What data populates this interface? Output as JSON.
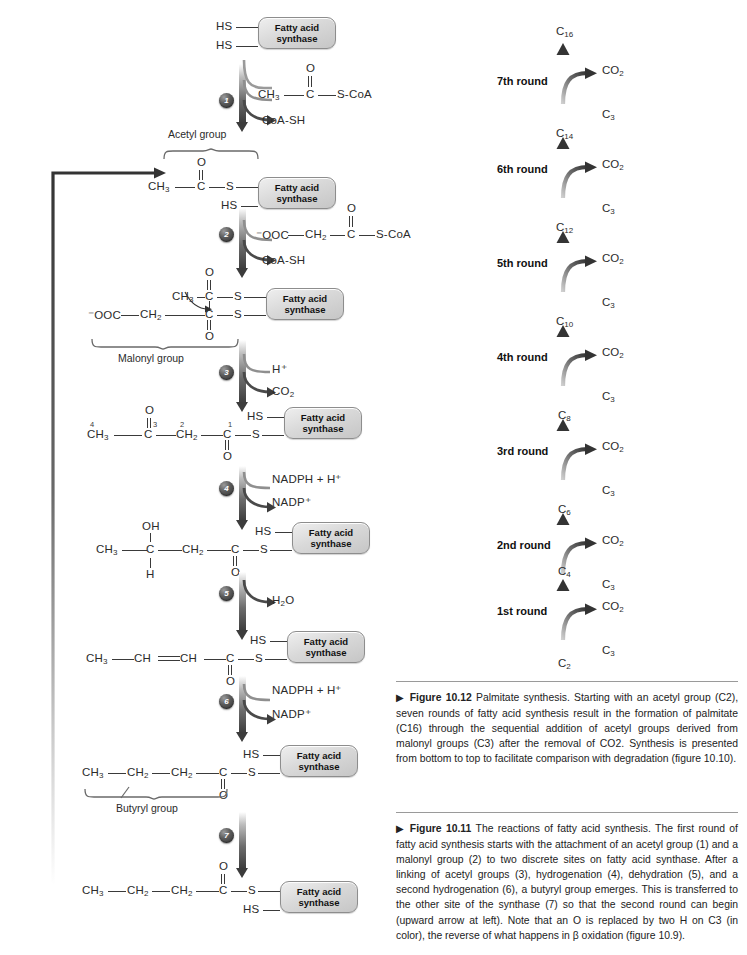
{
  "figure_11": {
    "enzyme_box_line1": "Fatty acid",
    "enzyme_box_line2": "synthase",
    "structures": {
      "s0": {
        "label_top": "HS",
        "label_bottom": "HS"
      },
      "s1_acetyl": {
        "ch3": "CH3",
        "c": "C",
        "o": "O",
        "s": "S",
        "hs": "HS"
      },
      "s2_malonyl": {
        "ooc": "⁻OOC",
        "ch2": "CH2",
        "ch3": "CH3",
        "c_top": "C",
        "c_bottom": "C",
        "o_top": "O",
        "o_bottom": "O",
        "s_top": "S",
        "s_bottom": "S"
      },
      "s3_acetoacetyl": {
        "c4": "4",
        "ch3": "CH3",
        "c3": "3",
        "c": "C",
        "o_up": "O",
        "c2": "2",
        "ch2": "CH2",
        "c1": "1",
        "c_carbonyl": "C",
        "o_down": "O",
        "s": "S",
        "hs": "HS"
      },
      "s4_hydroxy": {
        "ch3": "CH3",
        "oh": "OH",
        "c": "C",
        "h": "H",
        "ch2": "CH2",
        "c_carbonyl": "C",
        "o": "O",
        "s": "S",
        "hs": "HS"
      },
      "s5_enoyl": {
        "ch3": "CH3",
        "ch_a": "CH",
        "ch_b": "CH",
        "c": "C",
        "o": "O",
        "s": "S",
        "hs": "HS"
      },
      "s6_butyryl": {
        "ch3": "CH3",
        "ch2_a": "CH2",
        "ch2_b": "CH2",
        "c": "C",
        "o": "O",
        "s": "S",
        "hs": "HS"
      },
      "s7_transferred": {
        "ch3": "CH3",
        "ch2_a": "CH2",
        "ch2_b": "CH2",
        "c": "C",
        "o": "O",
        "s": "S",
        "hs": "HS"
      }
    },
    "braces": [
      {
        "id": "acetyl-group",
        "label": "Acetyl group"
      },
      {
        "id": "malonyl-group",
        "label": "Malonyl group"
      },
      {
        "id": "butyryl-group",
        "label": "Butyryl group"
      }
    ],
    "steps": [
      {
        "number": "1",
        "substrate": "CH3—C(=O)—S-CoA",
        "substrate_parts": {
          "ch3": "CH3",
          "c": "C",
          "o": "O",
          "scoa": "S-CoA"
        },
        "product": "CoA-SH"
      },
      {
        "number": "2",
        "substrate_parts": {
          "ooc": "⁻OOC",
          "ch2": "CH2",
          "c": "C",
          "o": "O",
          "scoa": "S-CoA"
        },
        "product": "CoA-SH"
      },
      {
        "number": "3",
        "substrate": "H⁺",
        "product": "CO2"
      },
      {
        "number": "4",
        "substrate": "NADPH + H⁺",
        "product": "NADP⁺"
      },
      {
        "number": "5",
        "substrate": "",
        "product": "H2O"
      },
      {
        "number": "6",
        "substrate": "NADPH + H⁺",
        "product": "NADP⁺"
      },
      {
        "number": "7",
        "substrate": "",
        "product": ""
      }
    ]
  },
  "figure_12": {
    "rounds": [
      {
        "label": "7th round",
        "product": "C16",
        "product_sub": "16",
        "co2": "CO2",
        "c3": "C3"
      },
      {
        "label": "6th round",
        "product": "C14",
        "product_sub": "14",
        "co2": "CO2",
        "c3": "C3"
      },
      {
        "label": "5th round",
        "product": "C12",
        "product_sub": "12",
        "co2": "CO2",
        "c3": "C3"
      },
      {
        "label": "4th round",
        "product": "C10",
        "product_sub": "10",
        "co2": "CO2",
        "c3": "C3"
      },
      {
        "label": "3rd round",
        "product": "C8",
        "product_sub": "8",
        "co2": "CO2",
        "c3": "C3"
      },
      {
        "label": "2nd round",
        "product": "C6",
        "product_sub": "6",
        "co2": "CO2",
        "c3": "C3"
      },
      {
        "label": "1st round",
        "product": "C4",
        "product_sub": "4",
        "co2": "CO2",
        "c3": "C3"
      }
    ],
    "start_label": "C2",
    "start_sub": "2"
  },
  "captions": {
    "fig1012": {
      "marker": "▶",
      "title": "Figure 10.12",
      "text": "Palmitate synthesis. Starting with an acetyl group (C2), seven rounds of fatty acid synthesis result in the formation of palmitate (C16) through the sequential addition of acetyl groups derived from malonyl groups (C3) after the removal of CO2. Synthesis is presented from bottom to top to facilitate comparison with degradation (figure 10.10)."
    },
    "fig1011": {
      "marker": "▶",
      "title": "Figure 10.11",
      "text": "The reactions of fatty acid synthesis. The first round of fatty acid synthesis starts with the attachment of an acetyl group (1) and a malonyl group (2) to two discrete sites on fatty acid synthase. After a linking of acetyl groups (3), hydrogenation (4), dehydration (5), and a second hydrogenation (6), a butyryl group emerges. This is transferred to the other site of the synthase (7) so that the second round can begin (upward arrow at left). Note that an O is replaced by two H on C3 (in color), the reverse of what happens in β oxidation (figure 10.9)."
    }
  },
  "colors": {
    "bond": "#3a3a3a",
    "arrow_dark": "#3c3c3c",
    "box_border": "#8d8d8d",
    "text": "#222222"
  }
}
